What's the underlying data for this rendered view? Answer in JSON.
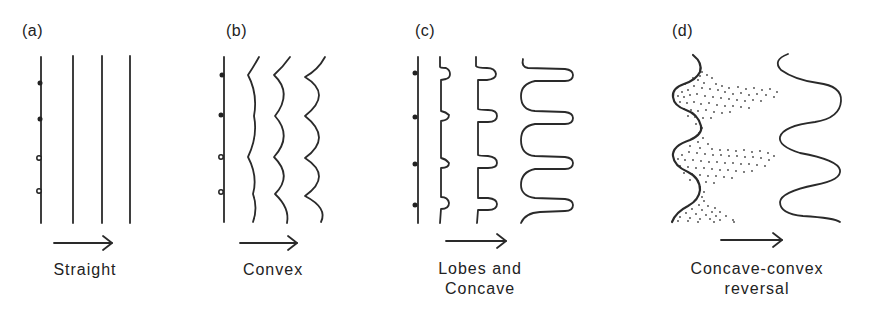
{
  "figure": {
    "panels": [
      {
        "id": "a",
        "label": "(a)",
        "caption_lines": [
          "Straight"
        ],
        "description": "Four straight parallel vertical lines with dots on first line"
      },
      {
        "id": "b",
        "label": "(b)",
        "caption_lines": [
          "Convex"
        ],
        "description": "Straight line followed by progressively scalloped convex lines"
      },
      {
        "id": "c",
        "label": "(c)",
        "caption_lines": [
          "Lobes and",
          "Concave"
        ],
        "description": "Straight line followed by lines developing lobes then deep concave bays"
      },
      {
        "id": "d",
        "label": "(d)",
        "caption_lines": [
          "Concave-convex",
          "reversal"
        ],
        "description": "Wavy line with stippled region, followed by reversed sinusoidal line"
      }
    ],
    "arrow_direction": "right",
    "colors": {
      "ink": "#2a2a2a",
      "background": "#ffffff"
    }
  }
}
